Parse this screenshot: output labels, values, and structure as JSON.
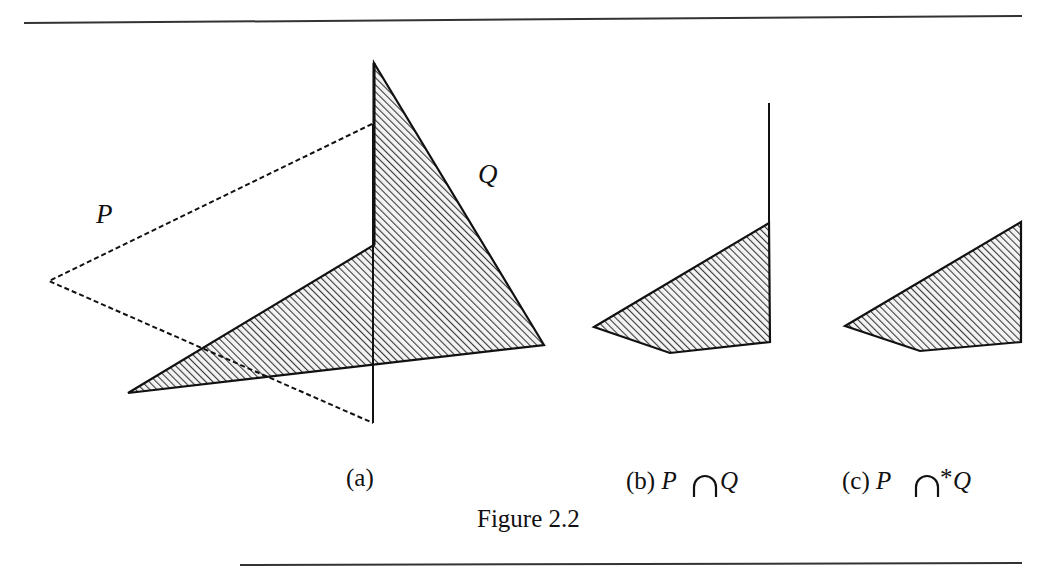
{
  "figure": {
    "title": "Figure 2.2",
    "rule_color": "#333333",
    "hatch_color": "#333333",
    "stroke_color": "#111111"
  },
  "panel_a": {
    "caption": "(a)",
    "label_p": "P",
    "label_q": "Q",
    "polygon_q": [
      [
        374,
        63
      ],
      [
        544,
        345
      ],
      [
        128,
        393
      ],
      [
        374,
        245
      ]
    ],
    "polygon_p_dashed": [
      [
        49,
        281
      ],
      [
        372,
        124
      ],
      [
        373,
        423
      ]
    ],
    "p_vertical_edge": [
      [
        373,
        124
      ],
      [
        373,
        423
      ]
    ]
  },
  "panel_b": {
    "caption_prefix": "(b) ",
    "caption_p": "P",
    "operator": "∩",
    "caption_q": "Q",
    "polygon": [
      [
        594,
        327
      ],
      [
        769,
        223
      ],
      [
        770,
        342
      ],
      [
        670,
        353
      ]
    ],
    "dangling_edge": [
      [
        769,
        103
      ],
      [
        769,
        223
      ]
    ]
  },
  "panel_c": {
    "caption_prefix": "(c) ",
    "caption_p": "P",
    "operator": "∩",
    "star": "*",
    "caption_q": "Q",
    "polygon": [
      [
        845,
        326
      ],
      [
        1021,
        222
      ],
      [
        1021,
        342
      ],
      [
        920,
        351
      ]
    ]
  }
}
